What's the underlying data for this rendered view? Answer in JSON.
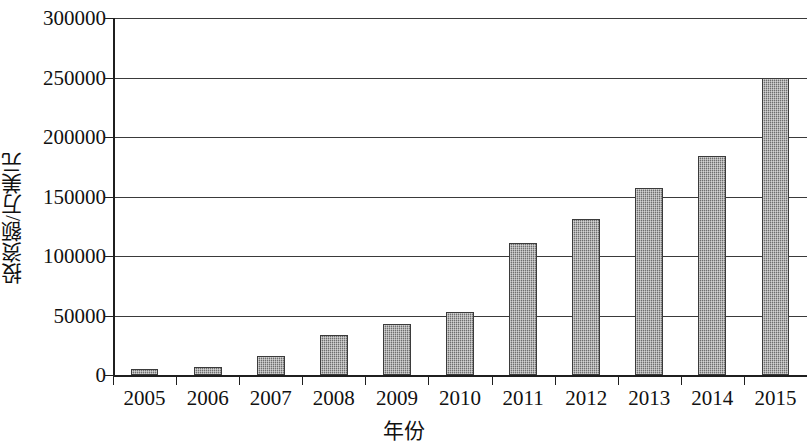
{
  "chart_data": {
    "type": "bar",
    "title": "",
    "xlabel": "年份",
    "ylabel": "投资额/万美元",
    "categories": [
      "2005",
      "2006",
      "2007",
      "2008",
      "2009",
      "2010",
      "2011",
      "2012",
      "2013",
      "2014",
      "2015"
    ],
    "values": [
      5000,
      6500,
      16000,
      33500,
      43000,
      53000,
      111000,
      131000,
      157500,
      184000,
      250000
    ],
    "series": [
      {
        "name": "投资额",
        "values": [
          5000,
          6500,
          16000,
          33500,
          43000,
          53000,
          111000,
          131000,
          157500,
          184000,
          250000
        ]
      }
    ],
    "ylim": [
      0,
      300000
    ],
    "y_ticks": [
      0,
      50000,
      100000,
      150000,
      200000,
      250000,
      300000
    ],
    "y_tick_labels": [
      "0",
      "50000",
      "100000",
      "150000",
      "200000",
      "250000",
      "300000"
    ],
    "grid": "horizontal",
    "legend": "none",
    "bar_fill_color": "#8d8d8d",
    "bar_border_color": "#3b3b3b",
    "axis_color": "#1f1f1f",
    "gridline_color": "#3a3a3a",
    "background_color": "#ffffff"
  }
}
